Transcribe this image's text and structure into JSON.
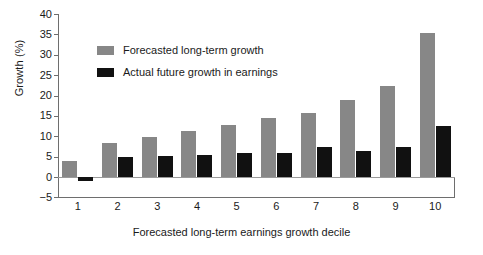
{
  "chart_data": {
    "type": "bar",
    "title": "",
    "xlabel": "Forecasted long-term earnings growth decile",
    "ylabel": "Growth (%)",
    "categories": [
      "1",
      "2",
      "3",
      "4",
      "5",
      "6",
      "7",
      "8",
      "9",
      "10"
    ],
    "ylim": [
      -5,
      40
    ],
    "yticks": [
      -5,
      0,
      5,
      10,
      15,
      20,
      25,
      30,
      35,
      40
    ],
    "grid": false,
    "legend_position": "upper left inside",
    "series": [
      {
        "name": "Forecasted long-term growth",
        "color": "#878787",
        "values": [
          4.0,
          8.3,
          9.8,
          11.3,
          12.7,
          14.5,
          15.7,
          18.8,
          22.4,
          35.4
        ]
      },
      {
        "name": "Actual future growth in earnings",
        "color": "#111111",
        "values": [
          -1.0,
          5.0,
          5.1,
          5.5,
          5.8,
          5.8,
          7.3,
          6.4,
          7.3,
          12.6
        ]
      }
    ]
  },
  "axis": {
    "y_title": "Growth (%)",
    "x_title": "Forecasted long-term earnings growth decile",
    "y_tick_labels": [
      "40",
      "35",
      "30",
      "25",
      "20",
      "15",
      "10",
      "5",
      "0",
      "−5"
    ],
    "x_tick_labels": [
      "1",
      "2",
      "3",
      "4",
      "5",
      "6",
      "7",
      "8",
      "9",
      "10"
    ]
  },
  "legend": {
    "items": [
      {
        "label": "Forecasted long-term growth",
        "swatch": "gray-swatch-icon",
        "color": "#878787"
      },
      {
        "label": "Actual future growth in earnings",
        "swatch": "black-swatch-icon",
        "color": "#111111"
      }
    ]
  }
}
